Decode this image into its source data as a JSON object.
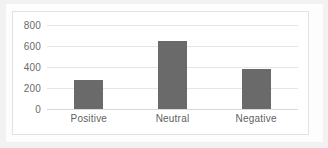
{
  "chart_data": {
    "type": "bar",
    "title": "",
    "xlabel": "",
    "ylabel": "",
    "categories": [
      "Positive",
      "Neutral",
      "Negative"
    ],
    "values": [
      280,
      650,
      380
    ],
    "ylim": [
      0,
      800
    ],
    "yticks": [
      0,
      200,
      400,
      600,
      800
    ],
    "ytick_labels": [
      "0",
      "200",
      "400",
      "600",
      "800"
    ],
    "grid": true,
    "legend": false,
    "legend_position": "none",
    "series": [
      {
        "name": "Sentiment count",
        "values": [
          280,
          650,
          380
        ],
        "color": "#6a6a6a"
      }
    ],
    "colors": {
      "bar": "#6a6a6a",
      "gridline": "#e6e6e6",
      "axis": "#d9d9d9",
      "tick_text": "#6b6b6b",
      "category_text": "#5f5f5f",
      "plot_background": "#ffffff",
      "frame_border": "#e2e2e2"
    }
  }
}
